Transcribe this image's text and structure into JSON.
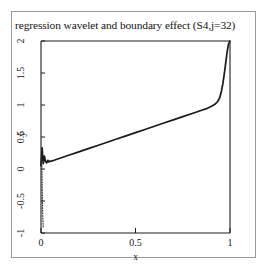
{
  "chart_data": {
    "type": "line",
    "title": "regression wavelet and boundary effect (S4,j=32)",
    "xlabel": "x",
    "ylabel": "ŷ",
    "xlim": [
      0,
      1
    ],
    "ylim": [
      -1,
      2
    ],
    "xticks": [
      "0",
      "0.5",
      "1"
    ],
    "xtick_values": [
      0,
      0.5,
      1
    ],
    "yticks": [
      "-1",
      "-0.5",
      "0",
      "0.5",
      "1",
      "1.5",
      "2"
    ],
    "ytick_values": [
      -1,
      -0.5,
      0,
      0.5,
      1,
      1.5,
      2
    ],
    "grid": false,
    "legend": "none",
    "series": [
      {
        "name": "wavelet regression estimate",
        "style": "solid",
        "color": "#1a1a1a",
        "x": [
          0.0,
          0.006,
          0.012,
          0.018,
          0.024,
          0.03,
          0.036,
          0.042,
          0.048,
          0.055,
          0.062,
          0.07,
          0.08,
          0.1,
          0.15,
          0.2,
          0.25,
          0.3,
          0.35,
          0.4,
          0.45,
          0.5,
          0.55,
          0.6,
          0.65,
          0.7,
          0.75,
          0.8,
          0.85,
          0.88,
          0.905,
          0.92,
          0.935,
          0.945,
          0.955,
          0.962,
          0.968,
          0.974,
          0.98,
          0.986,
          0.992,
          1.0
        ],
        "y": [
          0.055,
          0.33,
          0.085,
          0.2,
          0.12,
          0.095,
          0.135,
          0.11,
          0.125,
          0.122,
          0.13,
          0.137,
          0.148,
          0.168,
          0.218,
          0.268,
          0.318,
          0.368,
          0.418,
          0.468,
          0.518,
          0.568,
          0.618,
          0.668,
          0.718,
          0.768,
          0.818,
          0.868,
          0.918,
          0.948,
          0.985,
          1.01,
          1.055,
          1.11,
          1.22,
          1.33,
          1.45,
          1.58,
          1.72,
          1.85,
          1.95,
          2.0
        ]
      },
      {
        "name": "left boundary effect",
        "style": "dotted",
        "color": "#2a2a2a",
        "x": [
          0.004,
          0.004,
          0.005,
          0.006,
          0.007,
          0.008,
          0.009,
          0.01,
          0.011,
          0.012
        ],
        "y": [
          0.33,
          0.15,
          -0.05,
          -0.25,
          -0.42,
          -0.56,
          -0.68,
          -0.78,
          -0.86,
          -0.92
        ]
      }
    ],
    "annotations": []
  }
}
